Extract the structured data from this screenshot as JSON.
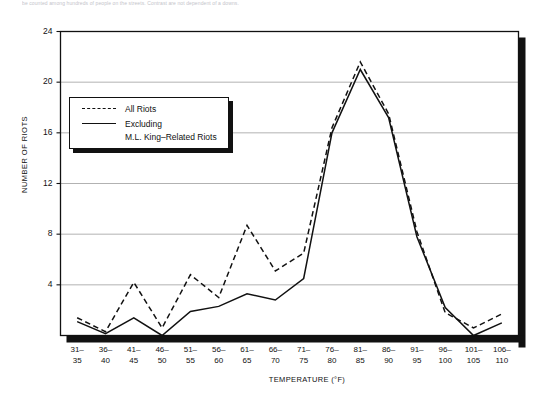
{
  "caption": "be counted among hundreds of people on the streets. Contrast are not dependent of a downs.",
  "axes": {
    "ylabel": "NUMBER OF RIOTS",
    "xlabel": "TEMPERATURE (°F)",
    "yticks": [
      "4",
      "8",
      "12",
      "16",
      "20",
      "24"
    ],
    "ymin": 0,
    "ymax": 24,
    "grid": "horizontal"
  },
  "legend": {
    "position": "top-left-inside",
    "entries": [
      {
        "key": "dashed",
        "label": "All Riots"
      },
      {
        "key": "solid",
        "label": "Excluding"
      },
      {
        "key": "none",
        "label": "M.L. King–Related Riots"
      }
    ]
  },
  "chart_data": {
    "type": "line",
    "title": "",
    "xlabel": "TEMPERATURE (°F)",
    "ylabel": "NUMBER OF RIOTS",
    "ylim": [
      0,
      24
    ],
    "yticks": [
      4,
      8,
      12,
      16,
      20,
      24
    ],
    "grid": true,
    "legend_position": "top-left-inside",
    "categories": [
      "31–35",
      "36–40",
      "41–45",
      "46–50",
      "51–55",
      "56–60",
      "61–65",
      "66–70",
      "71–75",
      "76–80",
      "81–85",
      "86–90",
      "91–95",
      "96–100",
      "101–105",
      "106–110"
    ],
    "categories_display": [
      [
        "31–",
        "35"
      ],
      [
        "36–",
        "40"
      ],
      [
        "41–",
        "45"
      ],
      [
        "46–",
        "50"
      ],
      [
        "51–",
        "55"
      ],
      [
        "56–",
        "60"
      ],
      [
        "61–",
        "65"
      ],
      [
        "66–",
        "70"
      ],
      [
        "71–",
        "75"
      ],
      [
        "76–",
        "80"
      ],
      [
        "81–",
        "85"
      ],
      [
        "86–",
        "90"
      ],
      [
        "91–",
        "95"
      ],
      [
        "96–",
        "100"
      ],
      [
        "101–",
        "105"
      ],
      [
        "106–",
        "110"
      ]
    ],
    "series": [
      {
        "name": "All Riots",
        "style": "dashed",
        "color": "#111111",
        "values": [
          1.4,
          0.3,
          4.2,
          0.6,
          4.8,
          3.0,
          8.7,
          5.1,
          6.5,
          16.4,
          21.6,
          17.5,
          8.2,
          1.8,
          0.6,
          1.7
        ]
      },
      {
        "name": "Excluding M.L. King–Related Riots",
        "style": "solid",
        "color": "#111111",
        "values": [
          1.1,
          0.15,
          1.4,
          0.0,
          1.9,
          2.3,
          3.3,
          2.8,
          4.5,
          16.0,
          21.0,
          17.2,
          7.8,
          2.2,
          0.0,
          1.0
        ]
      }
    ]
  },
  "colors": {
    "line": "#111111",
    "grid": "#a9a9a9",
    "frame": "#111111",
    "shadow": "#111111",
    "background": "#ffffff"
  }
}
